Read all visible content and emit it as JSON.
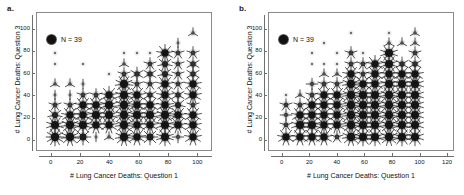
{
  "figure": {
    "panels": [
      {
        "panel_label": "a.",
        "legend_text": "N = 39",
        "xlabel": "# Lung Cancer Deaths: Question 1",
        "ylabel": "# Lung Cancer Deaths: Question 3"
      },
      {
        "panel_label": "b.",
        "legend_text": "N = 39",
        "xlabel": "# Lung Cancer Deaths: Question 1",
        "ylabel": "# Lung Cancer Deaths: Question 3"
      }
    ]
  },
  "chart_data": [
    {
      "type": "scatter",
      "title": "a.",
      "subtitle": "",
      "xlabel": "# Lung Cancer Deaths: Question 1",
      "ylabel": "# Lung Cancer Deaths: Question 3",
      "xlim": [
        -10,
        110
      ],
      "ylim": [
        -10,
        115
      ],
      "xticks": [
        0,
        20,
        40,
        60,
        80,
        100
      ],
      "yticks": [
        0,
        20,
        40,
        60,
        80,
        100
      ],
      "grid": false,
      "legend_position": "top-left",
      "legend_entries": [
        "N = 39"
      ],
      "annotations": [
        "N = 39"
      ],
      "marker_style": "sunflower",
      "marker_note": "petal count encodes number of coincident observations",
      "points": [
        {
          "x": 3,
          "y": 3,
          "count": 12
        },
        {
          "x": 3,
          "y": 13,
          "count": 10
        },
        {
          "x": 3,
          "y": 22,
          "count": 7
        },
        {
          "x": 3,
          "y": 31,
          "count": 5
        },
        {
          "x": 3,
          "y": 40,
          "count": 2
        },
        {
          "x": 3,
          "y": 50,
          "count": 3
        },
        {
          "x": 3,
          "y": 68,
          "count": 1
        },
        {
          "x": 3,
          "y": 78,
          "count": 1
        },
        {
          "x": 13,
          "y": 3,
          "count": 11
        },
        {
          "x": 13,
          "y": 13,
          "count": 11
        },
        {
          "x": 13,
          "y": 22,
          "count": 9
        },
        {
          "x": 13,
          "y": 31,
          "count": 5
        },
        {
          "x": 13,
          "y": 40,
          "count": 2
        },
        {
          "x": 13,
          "y": 50,
          "count": 3
        },
        {
          "x": 22,
          "y": 3,
          "count": 8
        },
        {
          "x": 22,
          "y": 13,
          "count": 10
        },
        {
          "x": 22,
          "y": 22,
          "count": 9
        },
        {
          "x": 22,
          "y": 31,
          "count": 9
        },
        {
          "x": 22,
          "y": 40,
          "count": 5
        },
        {
          "x": 22,
          "y": 50,
          "count": 2
        },
        {
          "x": 22,
          "y": 68,
          "count": 1
        },
        {
          "x": 31,
          "y": 3,
          "count": 2
        },
        {
          "x": 31,
          "y": 13,
          "count": 9
        },
        {
          "x": 31,
          "y": 22,
          "count": 10
        },
        {
          "x": 31,
          "y": 31,
          "count": 9
        },
        {
          "x": 31,
          "y": 40,
          "count": 5
        },
        {
          "x": 40,
          "y": 3,
          "count": 3
        },
        {
          "x": 40,
          "y": 13,
          "count": 9
        },
        {
          "x": 40,
          "y": 22,
          "count": 10
        },
        {
          "x": 40,
          "y": 31,
          "count": 10
        },
        {
          "x": 40,
          "y": 40,
          "count": 9
        },
        {
          "x": 40,
          "y": 59,
          "count": 1
        },
        {
          "x": 50,
          "y": 3,
          "count": 11
        },
        {
          "x": 50,
          "y": 13,
          "count": 11
        },
        {
          "x": 50,
          "y": 22,
          "count": 11
        },
        {
          "x": 50,
          "y": 31,
          "count": 11
        },
        {
          "x": 50,
          "y": 40,
          "count": 10
        },
        {
          "x": 50,
          "y": 50,
          "count": 11
        },
        {
          "x": 50,
          "y": 59,
          "count": 5
        },
        {
          "x": 50,
          "y": 68,
          "count": 3
        },
        {
          "x": 50,
          "y": 78,
          "count": 1
        },
        {
          "x": 59,
          "y": 3,
          "count": 9
        },
        {
          "x": 59,
          "y": 13,
          "count": 9
        },
        {
          "x": 59,
          "y": 22,
          "count": 10
        },
        {
          "x": 59,
          "y": 31,
          "count": 9
        },
        {
          "x": 59,
          "y": 40,
          "count": 9
        },
        {
          "x": 59,
          "y": 50,
          "count": 5
        },
        {
          "x": 59,
          "y": 59,
          "count": 6
        },
        {
          "x": 59,
          "y": 78,
          "count": 1
        },
        {
          "x": 68,
          "y": 3,
          "count": 8
        },
        {
          "x": 68,
          "y": 13,
          "count": 9
        },
        {
          "x": 68,
          "y": 22,
          "count": 10
        },
        {
          "x": 68,
          "y": 31,
          "count": 9
        },
        {
          "x": 68,
          "y": 40,
          "count": 6
        },
        {
          "x": 68,
          "y": 50,
          "count": 5
        },
        {
          "x": 68,
          "y": 59,
          "count": 6
        },
        {
          "x": 68,
          "y": 68,
          "count": 5
        },
        {
          "x": 68,
          "y": 78,
          "count": 1
        },
        {
          "x": 78,
          "y": 3,
          "count": 10
        },
        {
          "x": 78,
          "y": 13,
          "count": 10
        },
        {
          "x": 78,
          "y": 22,
          "count": 11
        },
        {
          "x": 78,
          "y": 31,
          "count": 9
        },
        {
          "x": 78,
          "y": 40,
          "count": 9
        },
        {
          "x": 78,
          "y": 50,
          "count": 9
        },
        {
          "x": 78,
          "y": 59,
          "count": 7
        },
        {
          "x": 78,
          "y": 68,
          "count": 7
        },
        {
          "x": 78,
          "y": 78,
          "count": 9
        },
        {
          "x": 87,
          "y": 3,
          "count": 4
        },
        {
          "x": 87,
          "y": 13,
          "count": 9
        },
        {
          "x": 87,
          "y": 22,
          "count": 9
        },
        {
          "x": 87,
          "y": 31,
          "count": 7
        },
        {
          "x": 87,
          "y": 40,
          "count": 6
        },
        {
          "x": 87,
          "y": 50,
          "count": 5
        },
        {
          "x": 87,
          "y": 59,
          "count": 5
        },
        {
          "x": 87,
          "y": 68,
          "count": 5
        },
        {
          "x": 87,
          "y": 78,
          "count": 5
        },
        {
          "x": 87,
          "y": 87,
          "count": 2
        },
        {
          "x": 97,
          "y": 3,
          "count": 9
        },
        {
          "x": 97,
          "y": 13,
          "count": 9
        },
        {
          "x": 97,
          "y": 22,
          "count": 9
        },
        {
          "x": 97,
          "y": 31,
          "count": 5
        },
        {
          "x": 97,
          "y": 40,
          "count": 9
        },
        {
          "x": 97,
          "y": 50,
          "count": 9
        },
        {
          "x": 97,
          "y": 59,
          "count": 6
        },
        {
          "x": 97,
          "y": 68,
          "count": 6
        },
        {
          "x": 97,
          "y": 78,
          "count": 5
        },
        {
          "x": 97,
          "y": 96,
          "count": 3
        }
      ]
    },
    {
      "type": "scatter",
      "title": "b.",
      "subtitle": "",
      "xlabel": "# Lung Cancer Deaths: Question 1",
      "ylabel": "# Lung Cancer Deaths: Question 3",
      "xlim": [
        -10,
        125
      ],
      "ylim": [
        -10,
        115
      ],
      "xticks": [
        0,
        20,
        40,
        60,
        80,
        100,
        120
      ],
      "yticks": [
        0,
        20,
        40,
        60,
        80,
        100
      ],
      "grid": false,
      "legend_position": "top-left",
      "legend_entries": [
        "N = 39"
      ],
      "annotations": [
        "N = 39"
      ],
      "marker_style": "sunflower",
      "marker_note": "petal count encodes number of coincident observations",
      "points": [
        {
          "x": 3,
          "y": 3,
          "count": 9
        },
        {
          "x": 3,
          "y": 13,
          "count": 5
        },
        {
          "x": 3,
          "y": 22,
          "count": 4
        },
        {
          "x": 3,
          "y": 31,
          "count": 5
        },
        {
          "x": 3,
          "y": 40,
          "count": 1
        },
        {
          "x": 13,
          "y": 3,
          "count": 9
        },
        {
          "x": 13,
          "y": 13,
          "count": 10
        },
        {
          "x": 13,
          "y": 22,
          "count": 9
        },
        {
          "x": 13,
          "y": 31,
          "count": 5
        },
        {
          "x": 13,
          "y": 40,
          "count": 3
        },
        {
          "x": 22,
          "y": 3,
          "count": 9
        },
        {
          "x": 22,
          "y": 13,
          "count": 10
        },
        {
          "x": 22,
          "y": 22,
          "count": 9
        },
        {
          "x": 22,
          "y": 31,
          "count": 9
        },
        {
          "x": 22,
          "y": 40,
          "count": 5
        },
        {
          "x": 22,
          "y": 50,
          "count": 4
        },
        {
          "x": 22,
          "y": 68,
          "count": 1
        },
        {
          "x": 22,
          "y": 78,
          "count": 1
        },
        {
          "x": 31,
          "y": 3,
          "count": 9
        },
        {
          "x": 31,
          "y": 13,
          "count": 9
        },
        {
          "x": 31,
          "y": 22,
          "count": 9
        },
        {
          "x": 31,
          "y": 31,
          "count": 9
        },
        {
          "x": 31,
          "y": 40,
          "count": 9
        },
        {
          "x": 31,
          "y": 50,
          "count": 5
        },
        {
          "x": 31,
          "y": 59,
          "count": 3
        },
        {
          "x": 31,
          "y": 68,
          "count": 1
        },
        {
          "x": 31,
          "y": 87,
          "count": 1
        },
        {
          "x": 40,
          "y": 3,
          "count": 5
        },
        {
          "x": 40,
          "y": 13,
          "count": 9
        },
        {
          "x": 40,
          "y": 22,
          "count": 9
        },
        {
          "x": 40,
          "y": 31,
          "count": 9
        },
        {
          "x": 40,
          "y": 40,
          "count": 9
        },
        {
          "x": 40,
          "y": 50,
          "count": 5
        },
        {
          "x": 40,
          "y": 59,
          "count": 3
        },
        {
          "x": 40,
          "y": 68,
          "count": 1
        },
        {
          "x": 40,
          "y": 78,
          "count": 1
        },
        {
          "x": 50,
          "y": 3,
          "count": 11
        },
        {
          "x": 50,
          "y": 13,
          "count": 11
        },
        {
          "x": 50,
          "y": 22,
          "count": 11
        },
        {
          "x": 50,
          "y": 31,
          "count": 11
        },
        {
          "x": 50,
          "y": 40,
          "count": 11
        },
        {
          "x": 50,
          "y": 50,
          "count": 11
        },
        {
          "x": 50,
          "y": 59,
          "count": 9
        },
        {
          "x": 50,
          "y": 68,
          "count": 5
        },
        {
          "x": 50,
          "y": 78,
          "count": 5
        },
        {
          "x": 50,
          "y": 96,
          "count": 1
        },
        {
          "x": 59,
          "y": 3,
          "count": 10
        },
        {
          "x": 59,
          "y": 13,
          "count": 10
        },
        {
          "x": 59,
          "y": 22,
          "count": 10
        },
        {
          "x": 59,
          "y": 31,
          "count": 10
        },
        {
          "x": 59,
          "y": 40,
          "count": 10
        },
        {
          "x": 59,
          "y": 50,
          "count": 9
        },
        {
          "x": 59,
          "y": 59,
          "count": 5
        },
        {
          "x": 59,
          "y": 68,
          "count": 5
        },
        {
          "x": 59,
          "y": 78,
          "count": 1
        },
        {
          "x": 68,
          "y": 3,
          "count": 10
        },
        {
          "x": 68,
          "y": 13,
          "count": 10
        },
        {
          "x": 68,
          "y": 22,
          "count": 10
        },
        {
          "x": 68,
          "y": 31,
          "count": 10
        },
        {
          "x": 68,
          "y": 40,
          "count": 10
        },
        {
          "x": 68,
          "y": 50,
          "count": 9
        },
        {
          "x": 68,
          "y": 59,
          "count": 9
        },
        {
          "x": 68,
          "y": 68,
          "count": 9
        },
        {
          "x": 78,
          "y": 3,
          "count": 11
        },
        {
          "x": 78,
          "y": 13,
          "count": 11
        },
        {
          "x": 78,
          "y": 22,
          "count": 11
        },
        {
          "x": 78,
          "y": 31,
          "count": 11
        },
        {
          "x": 78,
          "y": 40,
          "count": 11
        },
        {
          "x": 78,
          "y": 50,
          "count": 10
        },
        {
          "x": 78,
          "y": 59,
          "count": 9
        },
        {
          "x": 78,
          "y": 68,
          "count": 10
        },
        {
          "x": 78,
          "y": 78,
          "count": 10
        },
        {
          "x": 78,
          "y": 87,
          "count": 3
        },
        {
          "x": 78,
          "y": 96,
          "count": 1
        },
        {
          "x": 87,
          "y": 3,
          "count": 10
        },
        {
          "x": 87,
          "y": 13,
          "count": 10
        },
        {
          "x": 87,
          "y": 22,
          "count": 10
        },
        {
          "x": 87,
          "y": 31,
          "count": 10
        },
        {
          "x": 87,
          "y": 40,
          "count": 10
        },
        {
          "x": 87,
          "y": 50,
          "count": 10
        },
        {
          "x": 87,
          "y": 59,
          "count": 9
        },
        {
          "x": 87,
          "y": 68,
          "count": 6
        },
        {
          "x": 87,
          "y": 87,
          "count": 3
        },
        {
          "x": 97,
          "y": 3,
          "count": 10
        },
        {
          "x": 97,
          "y": 13,
          "count": 10
        },
        {
          "x": 97,
          "y": 22,
          "count": 10
        },
        {
          "x": 97,
          "y": 31,
          "count": 10
        },
        {
          "x": 97,
          "y": 40,
          "count": 10
        },
        {
          "x": 97,
          "y": 50,
          "count": 10
        },
        {
          "x": 97,
          "y": 59,
          "count": 9
        },
        {
          "x": 97,
          "y": 68,
          "count": 6
        },
        {
          "x": 97,
          "y": 78,
          "count": 5
        },
        {
          "x": 97,
          "y": 87,
          "count": 3
        },
        {
          "x": 97,
          "y": 96,
          "count": 3
        }
      ]
    }
  ]
}
